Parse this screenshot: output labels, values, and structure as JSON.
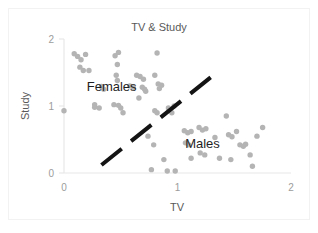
{
  "chart_data": {
    "type": "scatter",
    "title": "TV & Study",
    "xlabel": "TV",
    "ylabel": "Study",
    "xlim": [
      0,
      2
    ],
    "ylim": [
      0,
      2
    ],
    "xticks": [
      "0",
      "1",
      "2"
    ],
    "yticks": [
      "0",
      "1",
      "2"
    ],
    "xtick_values": [
      0,
      1,
      2
    ],
    "ytick_values": [
      0,
      1,
      2
    ],
    "grid": false,
    "legend": "none",
    "point_color": "#b4b4b4",
    "annotations": [
      {
        "text": "Females",
        "x": 0.42,
        "y": 1.22
      },
      {
        "text": "Males",
        "x": 1.22,
        "y": 0.38
      }
    ],
    "divider": {
      "style": "dashed",
      "color": "#141414",
      "x_start": 0.33,
      "y_start": 0.12,
      "x_end": 1.36,
      "y_end": 1.52
    },
    "series": [
      {
        "name": "points",
        "points": [
          [
            0.0,
            0.93
          ],
          [
            0.09,
            1.78
          ],
          [
            0.12,
            1.74
          ],
          [
            0.15,
            1.69
          ],
          [
            0.19,
            1.77
          ],
          [
            0.14,
            1.58
          ],
          [
            0.17,
            1.53
          ],
          [
            0.22,
            1.53
          ],
          [
            0.27,
            1.02
          ],
          [
            0.27,
            0.98
          ],
          [
            0.31,
            0.97
          ],
          [
            0.33,
            1.29
          ],
          [
            0.35,
            1.25
          ],
          [
            0.45,
            1.75
          ],
          [
            0.48,
            1.8
          ],
          [
            0.47,
            1.62
          ],
          [
            0.46,
            1.46
          ],
          [
            0.47,
            1.38
          ],
          [
            0.44,
            1.02
          ],
          [
            0.48,
            1.01
          ],
          [
            0.5,
            0.97
          ],
          [
            0.52,
            0.9
          ],
          [
            0.58,
            1.3
          ],
          [
            0.61,
            1.28
          ],
          [
            0.64,
            1.46
          ],
          [
            0.67,
            1.44
          ],
          [
            0.7,
            1.4
          ],
          [
            0.66,
            1.12
          ],
          [
            0.69,
            1.28
          ],
          [
            0.71,
            1.25
          ],
          [
            0.72,
            1.22
          ],
          [
            0.82,
            1.79
          ],
          [
            0.8,
            1.46
          ],
          [
            0.83,
            1.33
          ],
          [
            0.86,
            1.31
          ],
          [
            0.84,
            1.26
          ],
          [
            0.8,
            0.93
          ],
          [
            0.82,
            0.9
          ],
          [
            0.74,
            0.55
          ],
          [
            0.79,
            0.42
          ],
          [
            0.77,
            0.05
          ],
          [
            0.88,
            0.2
          ],
          [
            0.91,
            0.03
          ],
          [
            0.98,
            0.03
          ],
          [
            0.92,
            0.97
          ],
          [
            0.95,
            0.9
          ],
          [
            0.97,
            1.0
          ],
          [
            1.06,
            0.63
          ],
          [
            1.09,
            0.6
          ],
          [
            1.12,
            0.62
          ],
          [
            1.07,
            0.45
          ],
          [
            1.1,
            0.42
          ],
          [
            1.12,
            0.22
          ],
          [
            1.19,
            0.68
          ],
          [
            1.22,
            0.64
          ],
          [
            1.25,
            0.66
          ],
          [
            1.2,
            0.3
          ],
          [
            1.24,
            0.27
          ],
          [
            1.33,
            0.53
          ],
          [
            1.37,
            0.22
          ],
          [
            1.43,
            0.85
          ],
          [
            1.45,
            0.57
          ],
          [
            1.48,
            0.54
          ],
          [
            1.47,
            0.2
          ],
          [
            1.52,
            0.62
          ],
          [
            1.55,
            0.42
          ],
          [
            1.58,
            0.4
          ],
          [
            1.6,
            0.43
          ],
          [
            1.64,
            0.27
          ],
          [
            1.66,
            0.1
          ],
          [
            1.7,
            0.55
          ],
          [
            1.75,
            0.68
          ]
        ]
      }
    ]
  }
}
